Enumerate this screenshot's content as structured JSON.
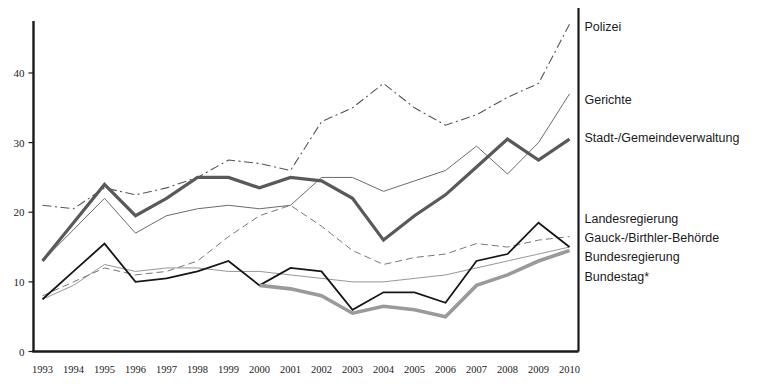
{
  "chart_data": {
    "type": "line",
    "title": "",
    "xlabel": "",
    "ylabel": "",
    "xlim": [
      1993,
      2010
    ],
    "ylim": [
      0,
      48
    ],
    "yticks": [
      0,
      10,
      20,
      30,
      40
    ],
    "grid": false,
    "legend_position": "right-inline",
    "x": [
      1993,
      1994,
      1995,
      1996,
      1997,
      1998,
      1999,
      2000,
      2001,
      2002,
      2003,
      2004,
      2005,
      2006,
      2007,
      2008,
      2009,
      2010
    ],
    "categories": [
      "1993",
      "1994",
      "1995",
      "1996",
      "1997",
      "1998",
      "1999",
      "2000",
      "2001",
      "2002",
      "2003",
      "2004",
      "2005",
      "2006",
      "2007",
      "2008",
      "2009",
      "2010"
    ],
    "series": [
      {
        "name": "Polizei",
        "style": "dash-dot",
        "color": "#555555",
        "width": 1.1,
        "values": [
          21.0,
          20.5,
          23.5,
          22.5,
          23.5,
          25.0,
          27.5,
          27.0,
          26.0,
          33.0,
          35.0,
          38.5,
          35.0,
          32.5,
          34.0,
          36.5,
          38.5,
          47.0
        ]
      },
      {
        "name": "Gerichte",
        "style": "solid",
        "color": "#6b6b6b",
        "width": 1.0,
        "values": [
          13.0,
          17.5,
          22.0,
          17.0,
          19.5,
          20.5,
          21.0,
          20.5,
          21.0,
          25.0,
          25.0,
          23.0,
          24.5,
          26.0,
          29.5,
          25.5,
          30.0,
          37.0
        ]
      },
      {
        "name": "Stadt-/Gemeindeverwaltung",
        "style": "solid-thick",
        "color": "#595959",
        "width": 3.2,
        "values": [
          13.0,
          18.5,
          24.0,
          19.5,
          22.0,
          25.0,
          25.0,
          23.5,
          25.0,
          24.5,
          22.0,
          16.0,
          19.5,
          22.5,
          26.5,
          30.5,
          27.5,
          30.5
        ]
      },
      {
        "name": "Landesregierung",
        "style": "solid-thin",
        "color": "#8a8a8a",
        "width": 0.9,
        "values": [
          7.5,
          9.5,
          12.5,
          11.5,
          12.0,
          12.0,
          11.5,
          11.5,
          11.0,
          10.5,
          10.0,
          10.0,
          10.5,
          11.0,
          12.0,
          13.0,
          14.0,
          15.0
        ]
      },
      {
        "name": "Gauck-/Birthler-Behörde",
        "style": "dashed",
        "color": "#777777",
        "width": 1.0,
        "values": [
          8.0,
          10.0,
          12.0,
          11.0,
          11.5,
          13.0,
          16.5,
          19.5,
          21.0,
          18.0,
          14.5,
          12.5,
          13.5,
          14.0,
          15.5,
          15.0,
          16.0,
          16.5
        ]
      },
      {
        "name": "Bundesregierung",
        "style": "solid-dark",
        "color": "#161616",
        "width": 1.8,
        "values": [
          7.5,
          11.5,
          15.5,
          10.0,
          10.5,
          11.5,
          13.0,
          9.5,
          12.0,
          11.5,
          6.0,
          8.5,
          8.5,
          7.0,
          13.0,
          14.0,
          18.5,
          15.0
        ]
      },
      {
        "name": "Bundestag*",
        "style": "solid-thick-light",
        "color": "#9a9a9a",
        "width": 3.6,
        "values": [
          null,
          null,
          null,
          null,
          null,
          null,
          null,
          9.5,
          9.0,
          8.0,
          5.5,
          6.5,
          6.0,
          5.0,
          9.5,
          11.0,
          13.0,
          14.5
        ]
      }
    ],
    "series_labels": [
      {
        "name": "Polizei",
        "y_value": 46.5
      },
      {
        "name": "Gerichte",
        "y_value": 36.0
      },
      {
        "name": "Stadt-/Gemeindeverwaltung",
        "y_value": 30.5
      },
      {
        "name": "Landesregierung",
        "y_value": 19.0
      },
      {
        "name": "Gauck-/Birthler-Behörde",
        "y_value": 16.2
      },
      {
        "name": "Bundesregierung",
        "y_value": 13.4
      },
      {
        "name": "Bundestag*",
        "y_value": 10.6
      }
    ]
  },
  "axes": {
    "y_tick_labels": [
      "0",
      "10",
      "20",
      "30",
      "40"
    ],
    "x_tick_labels": [
      "1993",
      "1994",
      "1995",
      "1996",
      "1997",
      "1998",
      "1999",
      "2000",
      "2001",
      "2002",
      "2003",
      "2004",
      "2005",
      "2006",
      "2007",
      "2008",
      "2009",
      "2010"
    ]
  },
  "title_fragment": ""
}
